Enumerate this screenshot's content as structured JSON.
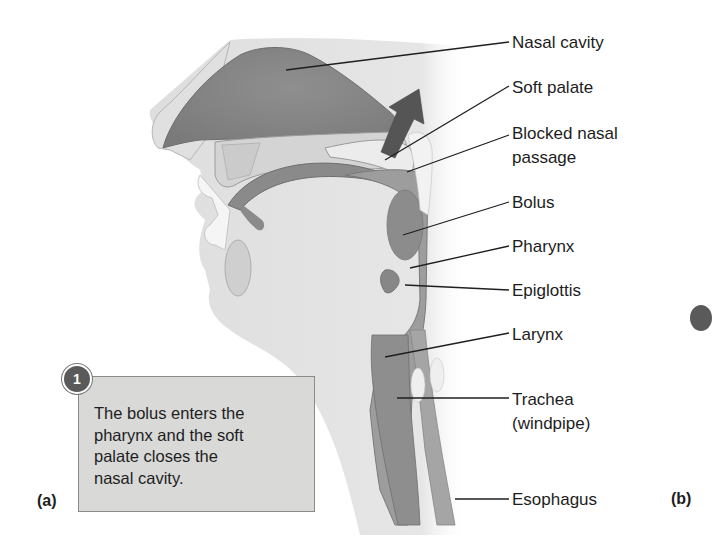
{
  "figure": {
    "panel_labels": {
      "a": "(a)",
      "b": "(b)"
    },
    "step": {
      "number": "1",
      "text": "The bolus enters the\npharynx and the soft\npalate closes the\nnasal cavity."
    },
    "labels": [
      {
        "id": "nasal-cavity",
        "text": "Nasal cavity"
      },
      {
        "id": "soft-palate",
        "text": "Soft palate"
      },
      {
        "id": "blocked-nasal-passage",
        "line1": "Blocked nasal",
        "line2": "passage"
      },
      {
        "id": "bolus",
        "text": "Bolus"
      },
      {
        "id": "pharynx",
        "text": "Pharynx"
      },
      {
        "id": "epiglottis",
        "text": "Epiglottis"
      },
      {
        "id": "larynx",
        "text": "Larynx"
      },
      {
        "id": "trachea",
        "line1": "Trachea",
        "line2": "(windpipe)"
      },
      {
        "id": "esophagus",
        "text": "Esophagus"
      }
    ],
    "colors": {
      "skin": "#e3e3e3",
      "tissue_dark": "#8c8c8c",
      "tissue_mid": "#a8a8a8",
      "arrow": "#555555",
      "box_fill": "#d9d9d8"
    }
  }
}
